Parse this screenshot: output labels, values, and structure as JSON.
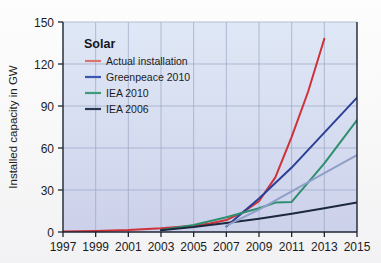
{
  "chart_data": {
    "type": "line",
    "title": "",
    "xlabel": "",
    "ylabel": "Installed capacity in GW",
    "xlim": [
      1997,
      2015
    ],
    "ylim": [
      0,
      150
    ],
    "xticks": [
      "1997",
      "1999",
      "2001",
      "2003",
      "2005",
      "2007",
      "2009",
      "2011",
      "2013",
      "2015"
    ],
    "xtick_values": [
      1997,
      1999,
      2001,
      2003,
      2005,
      2007,
      2009,
      2011,
      2013,
      2015
    ],
    "yticks": [
      "0",
      "30",
      "60",
      "90",
      "120",
      "150"
    ],
    "ytick_values": [
      0,
      30,
      60,
      90,
      120,
      150
    ],
    "grid": true,
    "grid_color": "#9aa6c4",
    "legend_position": "top-left",
    "legend_title": "Solar",
    "plot_background_top": "#dce6f5",
    "plot_background_bottom": "#cfd4ec",
    "series": [
      {
        "name": "Actual installation",
        "color": "#cf3138",
        "legend_swatch_color": "#d9756f",
        "x": [
          1997,
          1999,
          2001,
          2003,
          2005,
          2006,
          2007,
          2008,
          2009,
          2010,
          2011,
          2012,
          2013
        ],
        "values": [
          0.3,
          0.8,
          1.4,
          2.6,
          4.5,
          6.0,
          8.5,
          14.0,
          22.0,
          39.0,
          68.0,
          100.0,
          138.0
        ]
      },
      {
        "name": "Greenpeace 2010",
        "color": "#2b3f96",
        "legend_swatch_color": "#3a56b0",
        "x": [
          2007,
          2009,
          2011,
          2013,
          2015
        ],
        "values": [
          4.0,
          24.0,
          46.0,
          71.0,
          96.0
        ]
      },
      {
        "name": "IEA 2010",
        "color": "#2e8f6e",
        "legend_swatch_color": "#3f9b7c",
        "x": [
          2003,
          2005,
          2007,
          2009,
          2010,
          2011,
          2013,
          2015
        ],
        "values": [
          1.5,
          5.0,
          10.5,
          17.0,
          21.0,
          21.5,
          49.0,
          80.0
        ]
      },
      {
        "name": "IEA 2006",
        "color": "#1b2840",
        "legend_swatch_color": "#2a3752",
        "x": [
          2003,
          2005,
          2007,
          2009,
          2011,
          2013,
          2015
        ],
        "values": [
          1.2,
          3.5,
          6.5,
          9.5,
          13.0,
          17.0,
          21.0
        ]
      },
      {
        "name": "unlabeled-projection",
        "color": "#8f9fc8",
        "legend_swatch_color": "",
        "x": [
          2007,
          2009,
          2011,
          2013,
          2015
        ],
        "values": [
          4.5,
          16.0,
          29.0,
          42.0,
          55.0
        ]
      }
    ]
  }
}
